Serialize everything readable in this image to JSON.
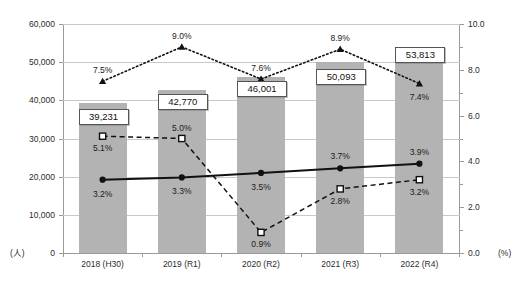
{
  "chart_data": {
    "type": "bar",
    "title": "",
    "categories": [
      "2018 (H30)",
      "2019 (R1)",
      "2020 (R2)",
      "2021 (R3)",
      "2022 (R4)"
    ],
    "xlabel": "",
    "ylabel": "(人)",
    "ylabel_right": "(%)",
    "ylim": [
      0,
      60000
    ],
    "ylim_right": [
      0,
      10.0
    ],
    "yticks": [
      "0",
      "10,000",
      "20,000",
      "30,000",
      "40,000",
      "50,000",
      "60,000"
    ],
    "ytick_values": [
      0,
      10000,
      20000,
      30000,
      40000,
      50000,
      60000
    ],
    "yticks_right": [
      "0.0",
      "2.0",
      "4.0",
      "6.0",
      "8.0",
      "10.0"
    ],
    "ytick_values_right": [
      0.0,
      2.0,
      4.0,
      6.0,
      8.0,
      10.0
    ],
    "grid": true,
    "legend_position": "none",
    "series": [
      {
        "name": "bars",
        "type": "bar",
        "axis": "left",
        "color": "#b3b3b3",
        "values": [
          39231,
          42770,
          46001,
          50093,
          53813
        ],
        "labels": [
          "39,231",
          "42,770",
          "46,001",
          "50,093",
          "53,813"
        ]
      },
      {
        "name": "dotted-triangle-series",
        "type": "line",
        "axis": "right",
        "marker": "triangle",
        "linestyle": "dotted",
        "color": "#111111",
        "values": [
          7.5,
          9.0,
          7.6,
          8.9,
          7.4
        ],
        "labels": [
          "7.5%",
          "9.0%",
          "7.6%",
          "8.9%",
          "7.4%"
        ]
      },
      {
        "name": "solid-circle-series",
        "type": "line",
        "axis": "right",
        "marker": "circle",
        "linestyle": "solid",
        "color": "#111111",
        "values": [
          3.2,
          3.3,
          3.5,
          3.7,
          3.9
        ],
        "labels": [
          "3.2%",
          "3.3%",
          "3.5%",
          "3.7%",
          "3.9%"
        ]
      },
      {
        "name": "dashed-square-series",
        "type": "line",
        "axis": "right",
        "marker": "square",
        "linestyle": "dashed",
        "color": "#111111",
        "values": [
          5.1,
          5.0,
          0.9,
          2.8,
          3.2
        ],
        "labels": [
          "5.1%",
          "5.0%",
          "0.9%",
          "2.8%",
          "3.2%"
        ]
      }
    ]
  }
}
